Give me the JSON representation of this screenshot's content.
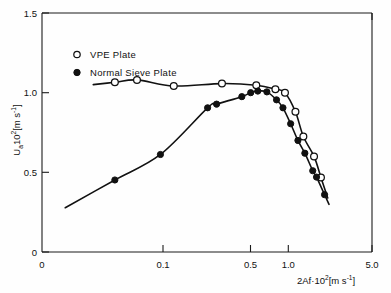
{
  "chart_data": {
    "type": "line",
    "title": "",
    "subtitle": "",
    "xlabel": "2Af·10²[m s⁻¹]",
    "xlabel_parts": {
      "base": "2Af·10",
      "exponent": "2",
      "units": "[m s",
      "units_exponent": "-1",
      "units_close": "]"
    },
    "ylabel": "Uₐ 10²[m s⁻¹]",
    "ylabel_parts": {
      "base": "U",
      "subscript": "a",
      "factor": "10",
      "exponent": "2",
      "units": "[m s",
      "units_exponent": "-1",
      "units_close": "]"
    },
    "xscale": "log",
    "yscale": "linear",
    "xlim": [
      0.033,
      5.0
    ],
    "ylim": [
      0.0,
      1.5
    ],
    "xticks": [
      0.1,
      0.5,
      1.0,
      5.0
    ],
    "xtick_labels": [
      "0.1",
      "0.5",
      "1.0",
      "5.0"
    ],
    "x_origin_label": "0",
    "yticks": [
      0,
      0.5,
      1.0,
      1.5
    ],
    "ytick_labels": [
      "0",
      "0.5",
      "1.0",
      "1.5"
    ],
    "grid": false,
    "legend_position": "upper-left-inside",
    "series": [
      {
        "name": "VPE Plate",
        "marker": "open-circle",
        "color": "#111111",
        "points": [
          {
            "x": 0.1,
            "y": 1.065
          },
          {
            "x": 0.14,
            "y": 1.08
          },
          {
            "x": 0.245,
            "y": 1.042
          },
          {
            "x": 0.51,
            "y": 1.057
          },
          {
            "x": 0.86,
            "y": 1.047
          },
          {
            "x": 1.15,
            "y": 1.022
          },
          {
            "x": 1.33,
            "y": 1.0
          },
          {
            "x": 1.56,
            "y": 0.88
          },
          {
            "x": 1.76,
            "y": 0.725
          },
          {
            "x": 2.07,
            "y": 0.6
          },
          {
            "x": 2.3,
            "y": 0.468
          }
        ],
        "line_x_start": 0.072,
        "line_x_end": 2.55
      },
      {
        "name": "Normal Sieve Plate",
        "marker": "filled-circle",
        "color": "#111111",
        "points": [
          {
            "x": 0.1,
            "y": 0.452
          },
          {
            "x": 0.2,
            "y": 0.612
          },
          {
            "x": 0.41,
            "y": 0.905
          },
          {
            "x": 0.47,
            "y": 0.928
          },
          {
            "x": 0.69,
            "y": 0.975
          },
          {
            "x": 0.79,
            "y": 1.0
          },
          {
            "x": 0.88,
            "y": 1.01
          },
          {
            "x": 1.01,
            "y": 1.005
          },
          {
            "x": 1.17,
            "y": 0.955
          },
          {
            "x": 1.29,
            "y": 0.905
          },
          {
            "x": 1.45,
            "y": 0.805
          },
          {
            "x": 1.62,
            "y": 0.7
          },
          {
            "x": 1.8,
            "y": 0.62
          },
          {
            "x": 2.03,
            "y": 0.51
          },
          {
            "x": 2.15,
            "y": 0.47
          },
          {
            "x": 2.43,
            "y": 0.36
          }
        ],
        "line_x_start": 0.047,
        "line_x_end": 2.6
      }
    ],
    "annotations": []
  },
  "legend": {
    "entries": [
      {
        "label": "VPE Plate",
        "marker": "open-circle"
      },
      {
        "label": "Normal Sieve Plate",
        "marker": "filled-circle"
      }
    ]
  },
  "colors": {
    "ink": "#111111",
    "background": "#fefefe",
    "marker_fill_open": "#ffffff",
    "marker_fill_closed": "#111111"
  }
}
